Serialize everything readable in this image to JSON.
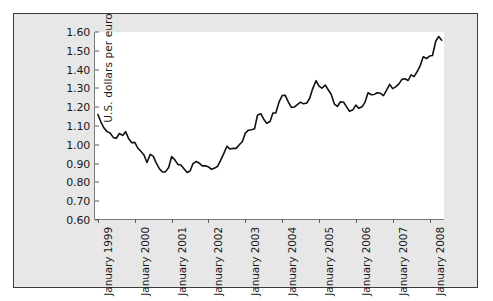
{
  "chart_data": {
    "type": "line",
    "title": "",
    "subtitle": "",
    "xlabel": "",
    "ylabel": "U.S. dollars per euro",
    "ylim": [
      0.6,
      1.6
    ],
    "ytick_step": 0.1,
    "ytick_labels": [
      "1.60",
      "1.50",
      "1.40",
      "1.30",
      "1.20",
      "1.10",
      "1.00",
      "0.90",
      "0.80",
      "0.70",
      "0.60"
    ],
    "ytick_values": [
      1.6,
      1.5,
      1.4,
      1.3,
      1.2,
      1.1,
      1.0,
      0.9,
      0.8,
      0.7,
      0.6
    ],
    "xtick_labels": [
      "January 1999",
      "January 2000",
      "January 2001",
      "January 2002",
      "January 2003",
      "January 2004",
      "January 2005",
      "January 2006",
      "January 2007",
      "January 2008"
    ],
    "xtick_values": [
      1999.0,
      2000.0,
      2001.0,
      2002.0,
      2003.0,
      2004.0,
      2005.0,
      2006.0,
      2007.0,
      2008.0
    ],
    "xlim": [
      1998.92,
      2008.42
    ],
    "grid": false,
    "legend": null,
    "line_color": "#111111",
    "series": [
      {
        "name": "U.S. dollars per euro",
        "x": [
          1999.0,
          1999.08,
          1999.17,
          1999.25,
          1999.33,
          1999.42,
          1999.5,
          1999.58,
          1999.67,
          1999.75,
          1999.83,
          1999.92,
          2000.0,
          2000.08,
          2000.17,
          2000.25,
          2000.33,
          2000.42,
          2000.5,
          2000.58,
          2000.67,
          2000.75,
          2000.83,
          2000.92,
          2001.0,
          2001.08,
          2001.17,
          2001.25,
          2001.33,
          2001.42,
          2001.5,
          2001.58,
          2001.67,
          2001.75,
          2001.83,
          2001.92,
          2002.0,
          2002.08,
          2002.17,
          2002.25,
          2002.33,
          2002.42,
          2002.5,
          2002.58,
          2002.67,
          2002.75,
          2002.83,
          2002.92,
          2003.0,
          2003.08,
          2003.17,
          2003.25,
          2003.33,
          2003.42,
          2003.5,
          2003.58,
          2003.67,
          2003.75,
          2003.83,
          2003.92,
          2004.0,
          2004.08,
          2004.17,
          2004.25,
          2004.33,
          2004.42,
          2004.5,
          2004.58,
          2004.67,
          2004.75,
          2004.83,
          2004.92,
          2005.0,
          2005.08,
          2005.17,
          2005.25,
          2005.33,
          2005.42,
          2005.5,
          2005.58,
          2005.67,
          2005.75,
          2005.83,
          2005.92,
          2006.0,
          2006.08,
          2006.17,
          2006.25,
          2006.33,
          2006.42,
          2006.5,
          2006.58,
          2006.67,
          2006.75,
          2006.83,
          2006.92,
          2007.0,
          2007.08,
          2007.17,
          2007.25,
          2007.33,
          2007.42,
          2007.5,
          2007.58,
          2007.67,
          2007.75,
          2007.83,
          2007.92,
          2008.0,
          2008.08,
          2008.17,
          2008.25,
          2008.33
        ],
        "values": [
          1.161,
          1.121,
          1.088,
          1.07,
          1.063,
          1.038,
          1.035,
          1.06,
          1.05,
          1.07,
          1.034,
          1.011,
          1.013,
          0.983,
          0.964,
          0.946,
          0.906,
          0.949,
          0.94,
          0.904,
          0.872,
          0.855,
          0.856,
          0.879,
          0.938,
          0.922,
          0.896,
          0.893,
          0.874,
          0.853,
          0.861,
          0.9,
          0.911,
          0.902,
          0.888,
          0.888,
          0.882,
          0.87,
          0.876,
          0.886,
          0.917,
          0.956,
          0.992,
          0.978,
          0.981,
          0.981,
          0.999,
          1.018,
          1.062,
          1.077,
          1.08,
          1.085,
          1.157,
          1.166,
          1.136,
          1.115,
          1.124,
          1.169,
          1.17,
          1.23,
          1.262,
          1.264,
          1.227,
          1.199,
          1.201,
          1.215,
          1.227,
          1.218,
          1.222,
          1.249,
          1.299,
          1.341,
          1.312,
          1.301,
          1.318,
          1.293,
          1.269,
          1.216,
          1.204,
          1.229,
          1.226,
          1.202,
          1.178,
          1.186,
          1.211,
          1.194,
          1.202,
          1.227,
          1.277,
          1.266,
          1.268,
          1.277,
          1.274,
          1.262,
          1.289,
          1.321,
          1.299,
          1.308,
          1.324,
          1.348,
          1.351,
          1.342,
          1.372,
          1.363,
          1.391,
          1.423,
          1.468,
          1.459,
          1.472,
          1.475,
          1.552,
          1.576,
          1.556
        ]
      }
    ]
  }
}
